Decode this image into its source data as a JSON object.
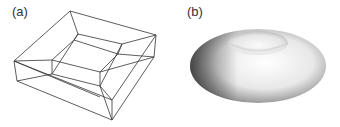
{
  "figure": {
    "panels": [
      {
        "label": "(a)",
        "description": "wireframe model of a square frame (torus mesh)"
      },
      {
        "label": "(b)",
        "description": "smooth shaded torus surface"
      }
    ]
  }
}
